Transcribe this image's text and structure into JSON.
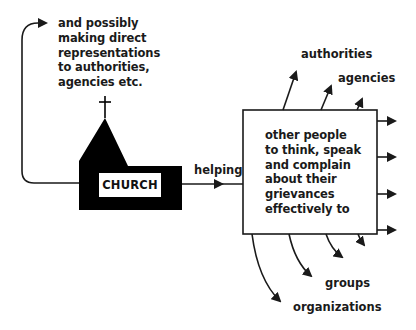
{
  "diagram": {
    "source_node": {
      "label": "CHURCH",
      "shape": "church-icon"
    },
    "edge_main": {
      "label": "helping"
    },
    "target_box": {
      "lines": [
        "other people",
        "to think, speak",
        "and complain",
        "about their",
        "grievances",
        "effectively to"
      ]
    },
    "feedback_note": {
      "lines": [
        "and possibly",
        "making direct",
        "representations",
        "to authorities,",
        "agencies etc."
      ]
    },
    "outputs_top": [
      "authorities",
      "agencies"
    ],
    "outputs_bottom": [
      "groups",
      "organizations"
    ],
    "colors": {
      "stroke": "#1a1a1a",
      "fill": "#000000",
      "background": "#ffffff"
    }
  }
}
